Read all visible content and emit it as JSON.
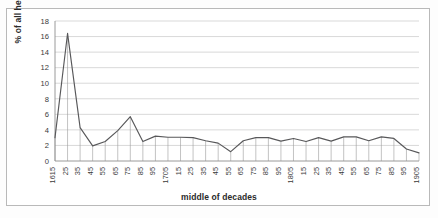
{
  "chart_data": {
    "type": "line",
    "title": "",
    "xlabel": "middle of decades",
    "ylabel": "% of all headwords",
    "ylim": [
      0,
      18
    ],
    "ytick_step": 2,
    "yticks": [
      0,
      2,
      4,
      6,
      8,
      10,
      12,
      14,
      16,
      18
    ],
    "grid": true,
    "legend": "none",
    "x": [
      1615,
      1625,
      1635,
      1645,
      1655,
      1665,
      1675,
      1685,
      1695,
      1705,
      1715,
      1725,
      1735,
      1745,
      1755,
      1765,
      1775,
      1785,
      1795,
      1805,
      1815,
      1825,
      1835,
      1845,
      1855,
      1865,
      1875,
      1885,
      1895,
      1905
    ],
    "xtick_labels": [
      "1615",
      "25",
      "35",
      "45",
      "55",
      "65",
      "75",
      "85",
      "95",
      "1705",
      "15",
      "25",
      "35",
      "45",
      "55",
      "65",
      "75",
      "85",
      "95",
      "1805",
      "15",
      "25",
      "35",
      "45",
      "55",
      "65",
      "75",
      "85",
      "95",
      "1905"
    ],
    "values": [
      3.0,
      16.4,
      4.3,
      1.95,
      2.5,
      3.9,
      5.7,
      2.5,
      3.2,
      3.05,
      3.05,
      3.0,
      2.6,
      2.3,
      1.2,
      2.6,
      3.0,
      3.0,
      2.55,
      2.9,
      2.5,
      3.0,
      2.55,
      3.1,
      3.1,
      2.6,
      3.1,
      2.9,
      1.55,
      1.05
    ],
    "series": [
      {
        "name": "% of all headwords",
        "color": "#58585a",
        "values": [
          3.0,
          16.4,
          4.3,
          1.95,
          2.5,
          3.9,
          5.7,
          2.5,
          3.2,
          3.05,
          3.05,
          3.0,
          2.6,
          2.3,
          1.2,
          2.6,
          3.0,
          3.0,
          2.55,
          2.9,
          2.5,
          3.0,
          2.55,
          3.1,
          3.1,
          2.6,
          3.1,
          2.9,
          1.55,
          1.05
        ]
      }
    ],
    "annotations": {
      "peak_label": "1625",
      "peak_value": 16.4
    }
  },
  "colors": {
    "series": "#58585a",
    "grid": "#c8c8c8",
    "axis": "#8f8f8f",
    "droplines": "#9a9a9a",
    "frame": "#b9b9b9",
    "text": "#2a2a2a",
    "background": "#ffffff"
  }
}
